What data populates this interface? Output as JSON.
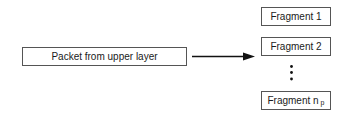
{
  "diagram": {
    "source": {
      "label": "Packet from upper layer"
    },
    "arrow": {
      "direction": "right",
      "from": "source",
      "to": "fragments"
    },
    "fragments": [
      {
        "label": "Fragment 1"
      },
      {
        "label": "Fragment 2"
      },
      {
        "label": "Fragment n",
        "subscript": "p"
      }
    ],
    "ellipsis": {
      "orientation": "vertical",
      "dot_count": 3
    },
    "colors": {
      "stroke": "#555555",
      "text": "#1a1a1a",
      "arrow": "#111111",
      "background": "#ffffff"
    }
  }
}
